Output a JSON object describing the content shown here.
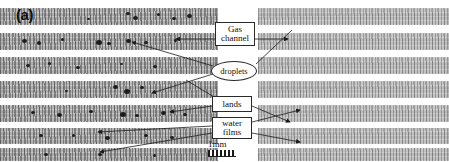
{
  "figure": {
    "type": "micrograph-annotated-figure",
    "panels": [
      {
        "id": "a",
        "label": "(a)",
        "description": "gas channel array with water droplets",
        "band_count": 7,
        "has_droplets": true
      },
      {
        "id": "b",
        "label": "(b)",
        "description": "gas channel array with water films",
        "band_count": 7,
        "has_droplets": false
      }
    ],
    "annotations": [
      {
        "id": "gas-channel",
        "label": "Gas channel",
        "shape": "rectangle",
        "lines": [
          "Gas",
          "channel"
        ]
      },
      {
        "id": "droplets",
        "label": "droplets",
        "shape": "ellipse",
        "lines": [
          "droplets"
        ]
      },
      {
        "id": "lands",
        "label": "lands",
        "shape": "rectangle",
        "lines": [
          "lands"
        ]
      },
      {
        "id": "water-films",
        "label": "water films",
        "shape": "rectangle",
        "lines": [
          "water",
          "films"
        ]
      }
    ],
    "scale": {
      "label": "1mm",
      "bar_style": "hatched"
    },
    "colors": {
      "band": "#b9b9b9",
      "band_b": "#c6c6c6",
      "background": "#ffffff",
      "ink": "#1b1b1b",
      "droplet": "#1d1d1d"
    }
  }
}
